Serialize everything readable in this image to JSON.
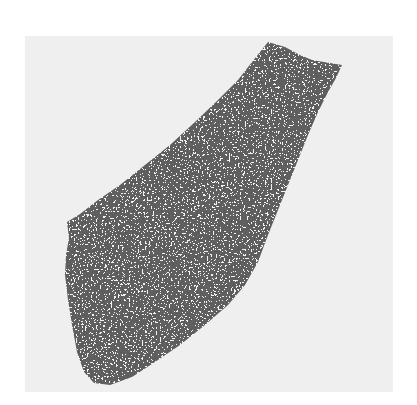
{
  "figure": {
    "colors": {
      "page_background": "#ffffff",
      "panel_background": "#efefef",
      "artifact_dark": "#1a1a1a",
      "artifact_light": "#f2f2f2"
    }
  }
}
